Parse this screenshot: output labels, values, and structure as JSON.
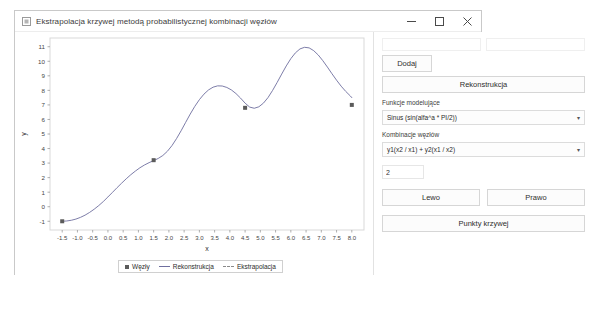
{
  "window": {
    "title": "Ekstrapolacja krzywej metodą probabilistycznej kombinacji węzłów",
    "app_icon": "app-icon",
    "minimize_label": "minimize-icon",
    "maximize_label": "maximize-icon",
    "close_label": "close-icon"
  },
  "controls": {
    "node_x_value": "",
    "node_x_placeholder": "",
    "node_y_value": "",
    "node_y_placeholder": "",
    "add_label": "Dodaj",
    "reconstruct_label": "Rekonstrukcja",
    "model_function_label": "Funkcje modelujące",
    "model_function_value": "Sinus (sin(alfa^a * PI/2))",
    "node_combination_label": "Kombinacje węzłów",
    "node_combination_value": "y1(x2 / x1) + y2(x1 / x2)",
    "count_value": "2",
    "left_label": "Lewo",
    "right_label": "Prawo",
    "curve_points_label": "Punkty krzywej",
    "caret": "▾"
  },
  "legend": {
    "nodes": "Węzły",
    "reconstruction": "Rekonstrukcja",
    "extrapolation": "Ekstrapolacja"
  },
  "chart_data": {
    "type": "line",
    "title": "",
    "xlabel": "x",
    "ylabel": "y",
    "xlim": [
      -1.9,
      8.4
    ],
    "ylim": [
      -1.6,
      11.6
    ],
    "xticks": [
      -1.5,
      -1.0,
      -0.5,
      0.0,
      0.5,
      1.0,
      1.5,
      2.0,
      2.5,
      3.0,
      3.5,
      4.0,
      4.5,
      5.0,
      5.5,
      6.0,
      6.5,
      7.0,
      7.5,
      8.0
    ],
    "xticklabels": [
      "-1.5",
      "-1.0",
      "-0.5",
      "0.0",
      "0.5",
      "1.0",
      "1.5",
      "2.0",
      "2.5",
      "3.0",
      "3.5",
      "4.0",
      "4.5",
      "5.0",
      "5.5",
      "6.0",
      "6.5",
      "7.0",
      "7.5",
      "8.0"
    ],
    "yticks": [
      -1,
      0,
      1,
      2,
      3,
      4,
      5,
      6,
      7,
      8,
      9,
      10,
      11
    ],
    "yticklabels": [
      "-1",
      "0",
      "1",
      "2",
      "3",
      "4",
      "5",
      "6",
      "7",
      "8",
      "9",
      "10",
      "11"
    ],
    "grid": false,
    "legend_position": "bottom",
    "series": [
      {
        "name": "Rekonstrukcja",
        "type": "line",
        "color": "#6e6e9e",
        "x": [
          -1.5,
          -1.35,
          -1.2,
          -1.05,
          -0.9,
          -0.75,
          -0.6,
          -0.45,
          -0.3,
          -0.15,
          0.0,
          0.15,
          0.3,
          0.45,
          0.6,
          0.75,
          0.9,
          1.05,
          1.2,
          1.35,
          1.5,
          1.65,
          1.8,
          1.95,
          2.1,
          2.25,
          2.4,
          2.55,
          2.7,
          2.85,
          3.0,
          3.15,
          3.3,
          3.45,
          3.6,
          3.75,
          3.9,
          4.05,
          4.2,
          4.35,
          4.5,
          4.65,
          4.8,
          4.95,
          5.1,
          5.25,
          5.4,
          5.55,
          5.7,
          5.85,
          6.0,
          6.15,
          6.3,
          6.45,
          6.6,
          6.75,
          6.9,
          7.05,
          7.2,
          7.35,
          7.5,
          7.65,
          7.8,
          7.95,
          8.0
        ],
        "y": [
          -1.0,
          -0.98,
          -0.93,
          -0.85,
          -0.73,
          -0.58,
          -0.39,
          -0.17,
          0.08,
          0.36,
          0.67,
          0.99,
          1.31,
          1.62,
          1.92,
          2.2,
          2.45,
          2.68,
          2.87,
          3.03,
          3.17,
          3.32,
          3.52,
          3.81,
          4.2,
          4.68,
          5.22,
          5.8,
          6.37,
          6.9,
          7.36,
          7.74,
          8.03,
          8.22,
          8.31,
          8.3,
          8.2,
          8.03,
          7.78,
          7.47,
          7.12,
          6.85,
          6.77,
          6.87,
          7.12,
          7.5,
          7.99,
          8.54,
          9.12,
          9.68,
          10.18,
          10.58,
          10.85,
          10.96,
          10.92,
          10.73,
          10.43,
          10.04,
          9.6,
          9.14,
          8.7,
          8.29,
          7.93,
          7.62,
          7.5
        ]
      },
      {
        "name": "Węzły",
        "type": "scatter",
        "color": "#5b5b5b",
        "x": [
          -1.5,
          1.5,
          4.5,
          8.0
        ],
        "y": [
          -1.0,
          3.2,
          6.8,
          7.0
        ]
      }
    ]
  }
}
